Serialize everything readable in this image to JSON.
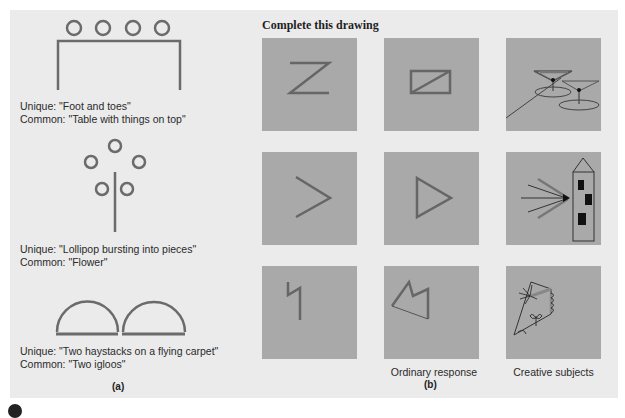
{
  "figure": {
    "panel_a": {
      "label": "(a)",
      "items": [
        {
          "unique": "Unique: \"Foot and toes\"",
          "common": "Common: \"Table with things on top\"",
          "drawing": "table-with-four-circles"
        },
        {
          "unique": "Unique: \"Lollipop bursting into pieces\"",
          "common": "Common: \"Flower\"",
          "drawing": "stem-with-five-circles"
        },
        {
          "unique": "Unique: \"Two haystacks on a flying carpet\"",
          "common": "Common: \"Two igloos\"",
          "drawing": "two-semicircles-on-line"
        }
      ]
    },
    "panel_b": {
      "title": "Complete this drawing",
      "label": "(b)",
      "column_labels": [
        "",
        "Ordinary response",
        "Creative subjects"
      ],
      "rows": [
        {
          "stimulus": "z-shape",
          "ordinary": "rectangle-with-diagonal",
          "creative": "cocktail-glasses"
        },
        {
          "stimulus": "chevron",
          "ordinary": "triangle",
          "creative": "tower-with-light-beams"
        },
        {
          "stimulus": "zigzag-line",
          "ordinary": "polygon",
          "creative": "abstract-figure-with-plant"
        }
      ]
    },
    "colors": {
      "panel_background": "#ebebeb",
      "box_fill": "#a9a9a9",
      "stroke_main": "#6b6b6b",
      "stroke_dark": "#3a3a3a"
    }
  }
}
